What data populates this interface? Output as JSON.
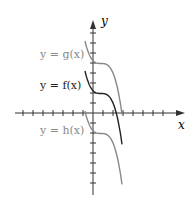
{
  "chart_data": {
    "type": "line",
    "title": "",
    "xlabel": "x",
    "ylabel": "y",
    "grid": false,
    "xlim": [
      -8,
      8
    ],
    "ylim": [
      -8,
      9
    ],
    "tick_spacing": 1,
    "series": [
      {
        "name": "y = g(x)",
        "label": "y = g(x)",
        "color": "#888888",
        "shift": 3,
        "plateau_y": 5
      },
      {
        "name": "y = f(x)",
        "label": "y = f(x)",
        "color": "#222222",
        "shift": 0,
        "plateau_y": 2
      },
      {
        "name": "y = h(x)",
        "label": "y = h(x)",
        "color": "#888888",
        "shift": -4,
        "plateau_y": -2
      }
    ]
  },
  "labels": {
    "g": "y = g(x)",
    "f": "y = f(x)",
    "h": "y = h(x)",
    "x_axis": "x",
    "y_axis": "y"
  }
}
